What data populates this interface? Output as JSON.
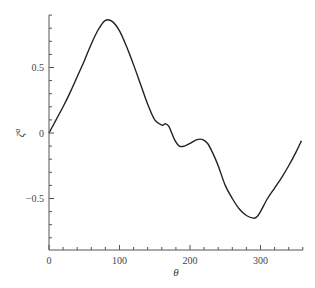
{
  "chart_data": {
    "type": "line",
    "title": "",
    "xlabel": "θ",
    "ylabel": "ζ",
    "ylabel_superscript": "a",
    "xlim": [
      0,
      360
    ],
    "ylim": [
      -0.9,
      0.9
    ],
    "grid": false,
    "legend": null,
    "x_ticks": [
      0,
      100,
      200,
      300
    ],
    "x_tick_labels": [
      "0",
      "100",
      "200",
      "300"
    ],
    "y_ticks": [
      -0.5,
      0,
      0.5
    ],
    "y_tick_labels": [
      "−0.5",
      "0",
      "0.5"
    ],
    "series": [
      {
        "name": "ζ^a(θ)",
        "color": "#222222",
        "x": [
          0,
          10,
          20,
          30,
          40,
          50,
          60,
          70,
          80,
          90,
          100,
          110,
          120,
          130,
          140,
          150,
          160,
          165,
          170,
          178,
          185,
          192,
          200,
          210,
          218,
          225,
          232,
          240,
          250,
          260,
          270,
          280,
          290,
          295,
          300,
          310,
          320,
          330,
          340,
          350,
          358
        ],
        "values": [
          0.0,
          0.1,
          0.2,
          0.31,
          0.43,
          0.55,
          0.68,
          0.79,
          0.86,
          0.85,
          0.78,
          0.66,
          0.52,
          0.37,
          0.22,
          0.1,
          0.06,
          0.07,
          0.05,
          -0.05,
          -0.1,
          -0.1,
          -0.08,
          -0.05,
          -0.05,
          -0.08,
          -0.15,
          -0.25,
          -0.4,
          -0.5,
          -0.58,
          -0.63,
          -0.65,
          -0.64,
          -0.6,
          -0.5,
          -0.42,
          -0.34,
          -0.25,
          -0.15,
          -0.06
        ]
      }
    ]
  }
}
